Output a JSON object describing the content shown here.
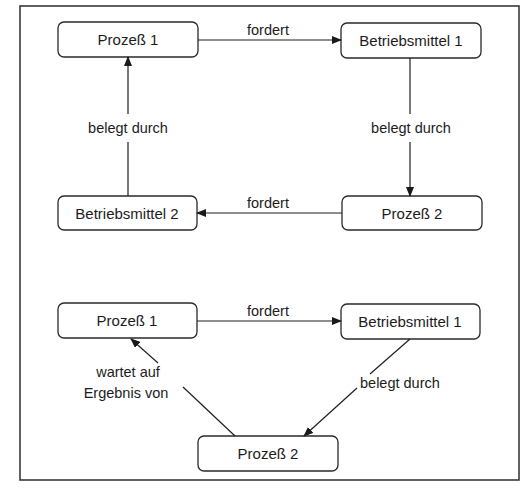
{
  "diagram": {
    "top": {
      "nodes": {
        "p1": "Prozeß 1",
        "bm1": "Betriebsmittel 1",
        "bm2": "Betriebsmittel 2",
        "p2": "Prozeß 2"
      },
      "edges": {
        "p1_to_bm1": "fordert",
        "bm1_to_p2": "belegt durch",
        "p2_to_bm2": "fordert",
        "bm2_to_p1": "belegt durch"
      }
    },
    "bottom": {
      "nodes": {
        "p1": "Prozeß 1",
        "bm1": "Betriebsmittel 1",
        "p2": "Prozeß 2"
      },
      "edges": {
        "p1_to_bm1": "fordert",
        "bm1_to_p2": "belegt durch",
        "p2_to_p1_line1": "wartet auf",
        "p2_to_p1_line2": "Ergebnis von"
      }
    }
  }
}
